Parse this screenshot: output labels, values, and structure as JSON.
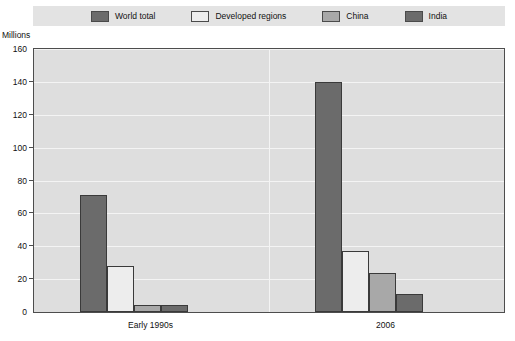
{
  "axis_unit_label": "Millions",
  "legend": [
    {
      "label": "World total",
      "color": "#6b6b6b",
      "swatch": "legend-swatch-world-total"
    },
    {
      "label": "Developed regions",
      "color": "#ededed",
      "swatch": "legend-swatch-developed-regions"
    },
    {
      "label": "China",
      "color": "#a8a8a8",
      "swatch": "legend-swatch-china"
    },
    {
      "label": "India",
      "color": "#6b6b6b",
      "swatch": "legend-swatch-india"
    }
  ],
  "chart_data": {
    "type": "bar",
    "title": "",
    "subtitle": "",
    "xlabel": "",
    "ylabel": "Millions",
    "ylim": [
      0,
      160
    ],
    "yticks": [
      0,
      20,
      40,
      60,
      80,
      100,
      120,
      140,
      160
    ],
    "grid": true,
    "legend_position": "top",
    "categories": [
      "Early 1990s",
      "2006"
    ],
    "series": [
      {
        "name": "World total",
        "color": "#6b6b6b",
        "values": [
          71,
          140
        ]
      },
      {
        "name": "Developed regions",
        "color": "#ededed",
        "values": [
          28,
          37
        ]
      },
      {
        "name": "China",
        "color": "#a8a8a8",
        "values": [
          4,
          24
        ]
      },
      {
        "name": "India",
        "color": "#6b6b6b",
        "values": [
          4,
          11
        ]
      }
    ]
  }
}
